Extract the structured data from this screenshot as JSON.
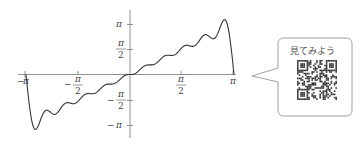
{
  "chart_data": {
    "type": "line",
    "title": "",
    "xlabel": "",
    "ylabel": "",
    "xlim": [
      -3.14159,
      3.14159
    ],
    "ylim": [
      -3.6,
      3.8
    ],
    "x_ticks": [
      {
        "value": -3.14159,
        "label_sign": "−",
        "label_num": "π",
        "label_den": ""
      },
      {
        "value": -1.5708,
        "label_sign": "−",
        "label_num": "π",
        "label_den": "2"
      },
      {
        "value": 1.5708,
        "label_sign": "",
        "label_num": "π",
        "label_den": "2"
      },
      {
        "value": 3.14159,
        "label_sign": "",
        "label_num": "π",
        "label_den": ""
      }
    ],
    "y_ticks": [
      {
        "value": 3.14159,
        "label_sign": "",
        "label_num": "π",
        "label_den": ""
      },
      {
        "value": 1.5708,
        "label_sign": "",
        "label_num": "π",
        "label_den": "2"
      },
      {
        "value": -1.5708,
        "label_sign": "−",
        "label_num": "π",
        "label_den": "2"
      },
      {
        "value": -3.14159,
        "label_sign": "−",
        "label_num": "π",
        "label_den": ""
      }
    ],
    "series": [
      {
        "name": "partial sum S_N(x) of x = 2Σ(-1)^(n+1) sin(nx)/n",
        "terms": 10,
        "color": "#333333"
      }
    ],
    "grid": false,
    "legend": false
  },
  "labels": {
    "pi": "π",
    "minus": "−",
    "two": "2"
  },
  "callout": {
    "text": "見てみよう",
    "qr_icon": "qr-code-icon"
  },
  "colors": {
    "axis": "#777777",
    "curve": "#333333",
    "bubble_border": "#888888"
  }
}
